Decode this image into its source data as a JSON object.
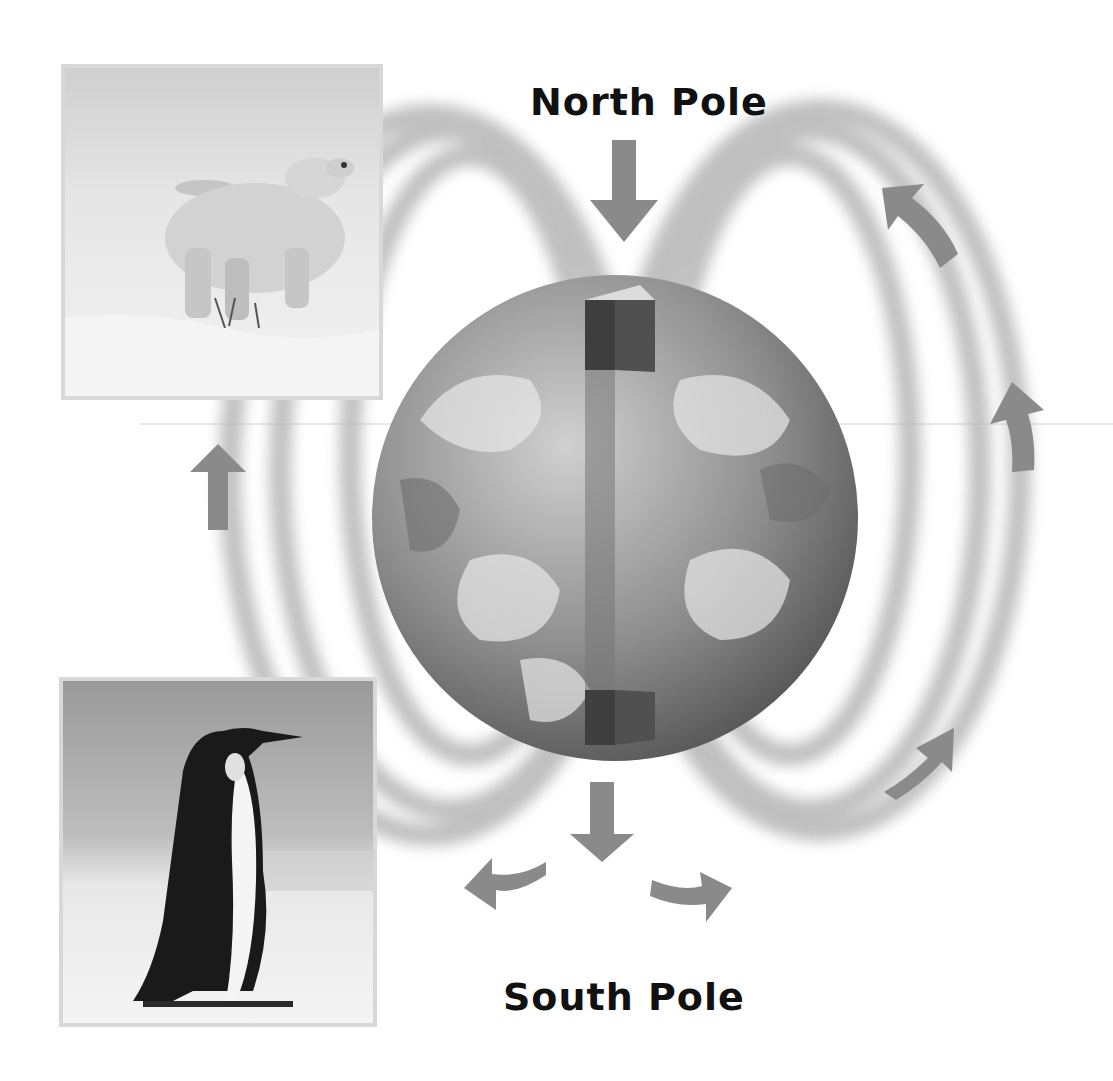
{
  "labels": {
    "north": "North Pole",
    "south": "South Pole"
  },
  "images": {
    "top_left": "polar bear standing in snow",
    "bottom_left": "emperor penguin on ice"
  },
  "colors": {
    "field_lines": "#b8b8b8",
    "arrows": "#8a8a8a",
    "globe_dark": "#6a6a6a",
    "globe_light": "#cfcfcf",
    "magnet_bar": "#4a4a4a",
    "photo_border": "#d8d8d8"
  },
  "arrows": [
    {
      "id": "north-down",
      "direction": "down"
    },
    {
      "id": "south-down",
      "direction": "down"
    },
    {
      "id": "south-left-curve",
      "direction": "left"
    },
    {
      "id": "south-right-curve",
      "direction": "right"
    },
    {
      "id": "right-upper-curve",
      "direction": "up-left"
    },
    {
      "id": "right-middle",
      "direction": "up"
    },
    {
      "id": "right-lower-curve",
      "direction": "up-right"
    },
    {
      "id": "left-middle",
      "direction": "up"
    }
  ]
}
